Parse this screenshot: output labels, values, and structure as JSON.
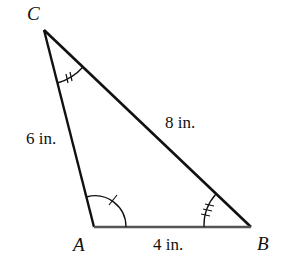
{
  "diagram": {
    "type": "triangle",
    "stroke_color": "#111111",
    "base_color": "#555555",
    "background": "#ffffff",
    "vertices": {
      "A": {
        "label": "A",
        "x": 94,
        "y": 227
      },
      "B": {
        "label": "B",
        "x": 251,
        "y": 227
      },
      "C": {
        "label": "C",
        "x": 44,
        "y": 30
      }
    },
    "sides": {
      "AC": {
        "label": "6 in."
      },
      "CB": {
        "label": "8 in."
      },
      "AB": {
        "label": "4 in."
      }
    },
    "angle_marks": {
      "A": {
        "ticks": 1
      },
      "C": {
        "ticks": 2
      },
      "B": {
        "ticks": 3
      }
    }
  }
}
